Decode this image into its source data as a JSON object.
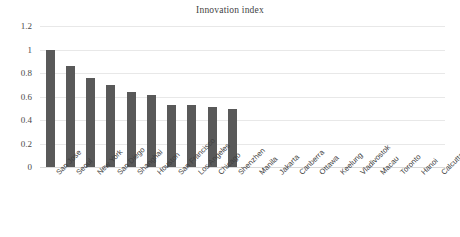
{
  "chart_data": {
    "type": "bar",
    "title": "Innovation index",
    "xlabel": "",
    "ylabel": "",
    "ylim": [
      0,
      1.2
    ],
    "yticks": [
      "0",
      "0.2",
      "0.4",
      "0.6",
      "0.8",
      "1",
      "1.2"
    ],
    "ytick_values": [
      0,
      0.2,
      0.4,
      0.6,
      0.8,
      1,
      1.2
    ],
    "grid": true,
    "legend": false,
    "legend_position": "none",
    "bar_color": "#595959",
    "gridline_color": "#e8e8e8",
    "categories": [
      "San Jose",
      "Seoul",
      "New York",
      "San Diego",
      "Shanghai",
      "Houston",
      "San Francisco",
      "Los Angeles",
      "Chicago",
      "Shenzhen",
      "Manila",
      "Jakarta",
      "Canberra",
      "Ottawa",
      "Keelung",
      "Vladivostok",
      "Macau",
      "Toronto",
      "Hanoi",
      "Calcutta"
    ],
    "values": [
      1.0,
      0.86,
      0.76,
      0.7,
      0.64,
      0.61,
      0.53,
      0.525,
      0.515,
      0.49,
      0,
      0,
      0,
      0,
      0,
      0,
      0,
      0,
      0,
      0
    ]
  }
}
